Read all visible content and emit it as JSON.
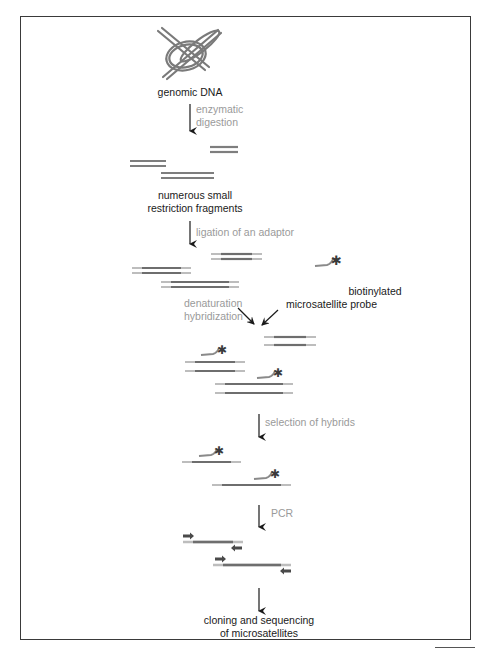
{
  "figure": {
    "colors": {
      "frame": "#3a3a3a",
      "strand_dark": "#6e6e6e",
      "strand_light": "#b5b5b5",
      "probe": "#8a8a8a",
      "biotin_star": "#3a3a3a",
      "arrow": "#1a1a1a",
      "step_label": "#9a9a9a",
      "stage_label": "#1a1a1a"
    }
  },
  "stages": {
    "genomic_dna": {
      "label": "genomic DNA",
      "icon": "tangled-dna-icon"
    },
    "fragments": {
      "line1": "numerous small",
      "line2": "restriction fragments"
    },
    "probe": {
      "line1": "biotinylated",
      "line2": "microsatellite probe",
      "icon": "biotin-star-icon"
    },
    "final": {
      "line1": "cloning and sequencing",
      "line2": "of microsatellites"
    }
  },
  "steps": {
    "digestion": {
      "line1": "enzymatic",
      "line2": "digestion"
    },
    "ligation": {
      "label": "ligation of an adaptor"
    },
    "hybridization": {
      "line1": "denaturation",
      "line2": "hybridization"
    },
    "selection": {
      "label": "selection of hybrids"
    },
    "pcr": {
      "label": "PCR"
    }
  },
  "flow": [
    "genomic DNA",
    "enzymatic digestion",
    "numerous small restriction fragments",
    "ligation of an adaptor",
    "denaturation hybridization + biotinylated microsatellite probe",
    "selection of hybrids",
    "PCR",
    "cloning and sequencing of microsatellites"
  ]
}
